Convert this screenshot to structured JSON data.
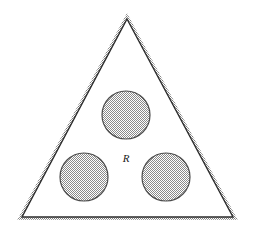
{
  "figure": {
    "background_color": "#ffffff",
    "canvas": {
      "width": 253,
      "height": 236
    }
  },
  "labels": {
    "region_label": "R"
  },
  "colors": {
    "outline": "#2b2b2b",
    "shadow_band": "#9a9a9a",
    "circle_fill": "#b4b4b4",
    "circle_outline": "#4d4d4d",
    "background": "#ffffff",
    "interior": "#ffffff"
  },
  "shapes": {
    "triangle": {
      "name": "outer-triangle",
      "vertices": [
        {
          "x": 127,
          "y": 19
        },
        {
          "x": 233,
          "y": 217
        },
        {
          "x": 22,
          "y": 217
        }
      ],
      "stroke_width": 1.4,
      "shadow_width": 5
    },
    "circles": [
      {
        "name": "top-circle",
        "cx": 126,
        "cy": 115,
        "r": 24
      },
      {
        "name": "bottom-left-circle",
        "cx": 84,
        "cy": 177,
        "r": 24
      },
      {
        "name": "bottom-right-circle",
        "cx": 166,
        "cy": 177,
        "r": 24
      }
    ],
    "label_position": {
      "x": 126,
      "y": 162
    }
  }
}
